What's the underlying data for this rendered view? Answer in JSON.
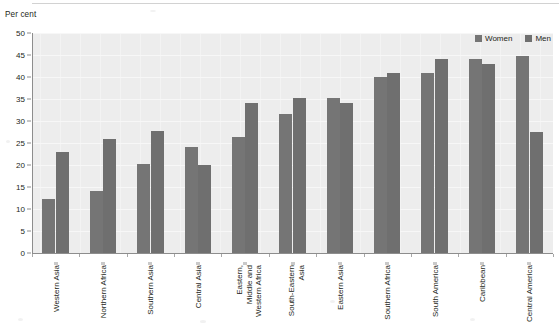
{
  "axis_title": "Per cent",
  "legend": {
    "position": "top-right",
    "items": [
      {
        "label": "Women",
        "color": "#757575",
        "swatch_icon": "square-swatch-icon"
      },
      {
        "label": "Men",
        "color": "#6f6f6f",
        "swatch_icon": "square-swatch-icon"
      }
    ]
  },
  "yaxis": {
    "label": "Per cent",
    "ticks": [
      "0",
      "5",
      "10",
      "15",
      "20",
      "25",
      "30",
      "35",
      "40",
      "45",
      "50"
    ],
    "min": 0,
    "max": 50,
    "step": 5
  },
  "chart_data": {
    "type": "bar",
    "title": "",
    "subtitle": "",
    "xlabel": "",
    "ylabel": "Per cent",
    "ylim": [
      0,
      50
    ],
    "ytick_step": 5,
    "grid": true,
    "grid_axis": "y",
    "legend_position": "top-right",
    "categories": [
      "Western Asia",
      "Northern Africa",
      "Southern Asia",
      "Central Asia",
      "Eastern, Middle and Western Africa",
      "South-Eastern Asia",
      "Eastern Asia",
      "Southern Africa",
      "South America",
      "Caribbean",
      "Central America"
    ],
    "category_lines": [
      [
        "Western Asia"
      ],
      [
        "Northern Africa"
      ],
      [
        "Southern Asia"
      ],
      [
        "Central Asia"
      ],
      [
        "Eastern,",
        "Middle and",
        "Western Africa"
      ],
      [
        "South-Eastern",
        "Asia"
      ],
      [
        "Eastern Asia"
      ],
      [
        "Southern Africa"
      ],
      [
        "South America"
      ],
      [
        "Caribbean"
      ],
      [
        "Central America"
      ]
    ],
    "series": [
      {
        "name": "Women",
        "color": "#757575",
        "values": [
          12.3,
          14.0,
          20.2,
          24.0,
          26.3,
          31.5,
          35.3,
          40.0,
          41.0,
          44.2,
          44.8
        ]
      },
      {
        "name": "Men",
        "color": "#6f6f6f",
        "values": [
          23.0,
          26.0,
          27.8,
          20.0,
          34.0,
          35.2,
          34.0,
          41.0,
          44.0,
          43.0,
          27.5
        ]
      }
    ]
  }
}
